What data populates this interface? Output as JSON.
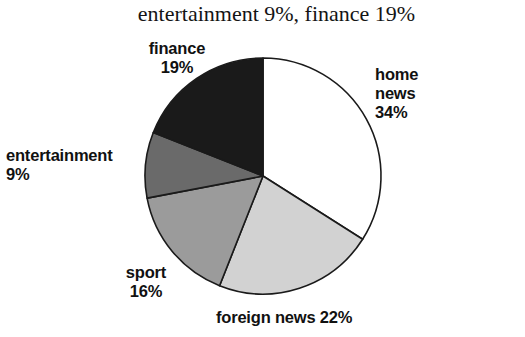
{
  "title": "entertainment 9%, finance 19%",
  "chart_data": {
    "type": "pie",
    "title": "entertainment 9%, finance 19%",
    "xlabel": "",
    "ylabel": "",
    "legend": "none",
    "grid": false,
    "start_angle_deg": 0,
    "direction": "clockwise",
    "unit": "%",
    "categories": [
      "home news",
      "foreign news",
      "sport",
      "entertainment",
      "finance"
    ],
    "values": [
      34,
      22,
      16,
      9,
      19
    ],
    "colors": [
      "#ffffff",
      "#d2d2d2",
      "#9b9b9b",
      "#6a6a6a",
      "#1a1a1a"
    ],
    "slices": [
      {
        "name": "home news",
        "value": 34,
        "color": "#ffffff",
        "start_deg": 0.0,
        "end_deg": 122.4
      },
      {
        "name": "foreign news",
        "value": 22,
        "color": "#d2d2d2",
        "start_deg": 122.4,
        "end_deg": 201.6
      },
      {
        "name": "sport",
        "value": 16,
        "color": "#9b9b9b",
        "start_deg": 201.6,
        "end_deg": 259.2
      },
      {
        "name": "entertainment",
        "value": 9,
        "color": "#6a6a6a",
        "start_deg": 259.2,
        "end_deg": 291.6
      },
      {
        "name": "finance",
        "value": 19,
        "color": "#1a1a1a",
        "start_deg": 291.6,
        "end_deg": 360.0
      }
    ]
  },
  "labels": {
    "finance": "finance\n19%",
    "home_news": "home\nnews\n34%",
    "entertainment": "entertainment\n9%",
    "sport": "sport\n16%",
    "foreign_news": "foreign news 22%"
  }
}
